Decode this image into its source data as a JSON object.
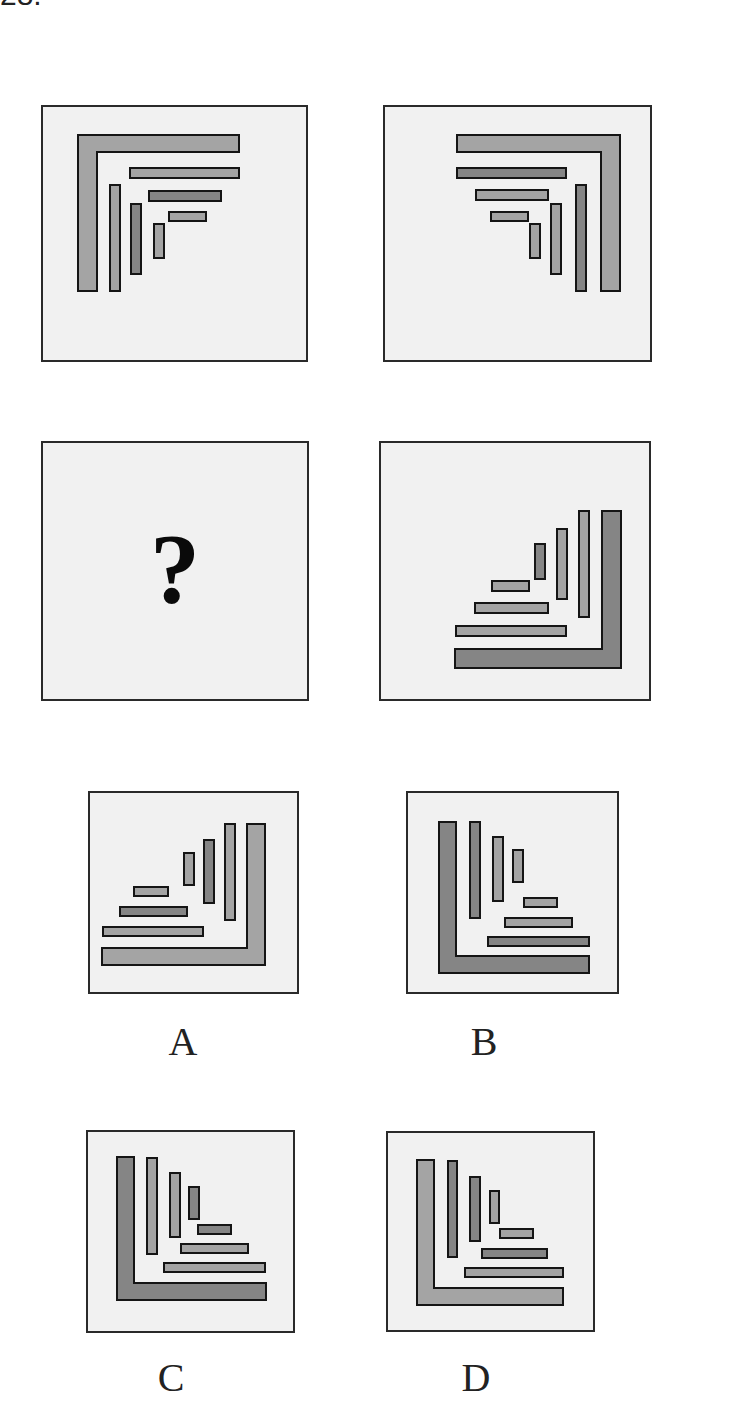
{
  "question": {
    "number": "28."
  },
  "colors": {
    "panel_bg": "#f1f1f1",
    "border": "#2a2a2a",
    "light": "#a4a4a4",
    "dark": "#858585",
    "stroke": "#151515"
  },
  "question_mark": "?",
  "panels": [
    {
      "id": "p1",
      "x": 41,
      "y": 105,
      "w": 267,
      "h": 257,
      "L": {
        "points": "37,30 198,30 198,47 56,47 56,186 37,186",
        "shade": "light"
      },
      "bars": [
        {
          "x": 89,
          "y": 63,
          "w": 109,
          "h": 10,
          "shade": "light"
        },
        {
          "x": 108,
          "y": 86,
          "w": 72,
          "h": 10,
          "shade": "dark"
        },
        {
          "x": 128,
          "y": 107,
          "w": 37,
          "h": 9,
          "shade": "light"
        },
        {
          "x": 69,
          "y": 80,
          "w": 10,
          "h": 106,
          "shade": "light"
        },
        {
          "x": 90,
          "y": 99,
          "w": 10,
          "h": 70,
          "shade": "dark"
        },
        {
          "x": 113,
          "y": 119,
          "w": 10,
          "h": 34,
          "shade": "light"
        }
      ]
    },
    {
      "id": "p2",
      "x": 383,
      "y": 105,
      "w": 269,
      "h": 257,
      "L": {
        "points": "74,30 237,30 237,186 218,186 218,47 74,47",
        "shade": "light"
      },
      "bars": [
        {
          "x": 74,
          "y": 63,
          "w": 109,
          "h": 10,
          "shade": "dark"
        },
        {
          "x": 93,
          "y": 85,
          "w": 72,
          "h": 10,
          "shade": "light"
        },
        {
          "x": 108,
          "y": 107,
          "w": 37,
          "h": 9,
          "shade": "light"
        },
        {
          "x": 193,
          "y": 80,
          "w": 10,
          "h": 106,
          "shade": "dark"
        },
        {
          "x": 168,
          "y": 99,
          "w": 10,
          "h": 70,
          "shade": "light"
        },
        {
          "x": 147,
          "y": 119,
          "w": 10,
          "h": 34,
          "shade": "light"
        }
      ]
    },
    {
      "id": "p3",
      "x": 41,
      "y": 441,
      "w": 268,
      "h": 260,
      "question_panel": true
    },
    {
      "id": "p4",
      "x": 379,
      "y": 441,
      "w": 272,
      "h": 260,
      "L": {
        "points": "223,70 242,70 242,227 76,227 76,208 223,208",
        "shade": "dark"
      },
      "bars": [
        {
          "x": 77,
          "y": 185,
          "w": 110,
          "h": 10,
          "shade": "light"
        },
        {
          "x": 96,
          "y": 162,
          "w": 73,
          "h": 10,
          "shade": "light"
        },
        {
          "x": 113,
          "y": 140,
          "w": 37,
          "h": 10,
          "shade": "light"
        },
        {
          "x": 200,
          "y": 70,
          "w": 10,
          "h": 106,
          "shade": "light"
        },
        {
          "x": 178,
          "y": 88,
          "w": 10,
          "h": 70,
          "shade": "light"
        },
        {
          "x": 156,
          "y": 103,
          "w": 10,
          "h": 35,
          "shade": "dark"
        }
      ]
    },
    {
      "id": "optA",
      "x": 88,
      "y": 791,
      "w": 211,
      "h": 203,
      "label": "A",
      "label_x": 168,
      "label_y": 1018,
      "L": {
        "points": "159,33 177,33 177,174 14,174 14,157 159,157",
        "shade": "light"
      },
      "bars": [
        {
          "x": 15,
          "y": 136,
          "w": 100,
          "h": 9,
          "shade": "light"
        },
        {
          "x": 32,
          "y": 116,
          "w": 67,
          "h": 9,
          "shade": "dark"
        },
        {
          "x": 46,
          "y": 96,
          "w": 34,
          "h": 9,
          "shade": "light"
        },
        {
          "x": 137,
          "y": 33,
          "w": 10,
          "h": 96,
          "shade": "light"
        },
        {
          "x": 116,
          "y": 49,
          "w": 10,
          "h": 63,
          "shade": "dark"
        },
        {
          "x": 96,
          "y": 62,
          "w": 10,
          "h": 32,
          "shade": "light"
        }
      ]
    },
    {
      "id": "optB",
      "x": 406,
      "y": 791,
      "w": 213,
      "h": 203,
      "label": "B",
      "label_x": 469,
      "label_y": 1018,
      "L": {
        "points": "33,31 50,31 50,165 183,165 183,182 33,182",
        "shade": "dark"
      },
      "bars": [
        {
          "x": 82,
          "y": 146,
          "w": 101,
          "h": 9,
          "shade": "dark"
        },
        {
          "x": 99,
          "y": 127,
          "w": 67,
          "h": 9,
          "shade": "light"
        },
        {
          "x": 118,
          "y": 107,
          "w": 33,
          "h": 9,
          "shade": "light"
        },
        {
          "x": 64,
          "y": 31,
          "w": 10,
          "h": 96,
          "shade": "dark"
        },
        {
          "x": 87,
          "y": 46,
          "w": 10,
          "h": 64,
          "shade": "light"
        },
        {
          "x": 107,
          "y": 59,
          "w": 10,
          "h": 32,
          "shade": "light"
        }
      ]
    },
    {
      "id": "optC",
      "x": 86,
      "y": 1130,
      "w": 209,
      "h": 203,
      "label": "C",
      "label_x": 156,
      "label_y": 1354,
      "L": {
        "points": "31,27 48,27 48,153 180,153 180,170 31,170",
        "shade": "dark"
      },
      "bars": [
        {
          "x": 78,
          "y": 133,
          "w": 101,
          "h": 9,
          "shade": "light"
        },
        {
          "x": 95,
          "y": 114,
          "w": 67,
          "h": 9,
          "shade": "light"
        },
        {
          "x": 112,
          "y": 95,
          "w": 33,
          "h": 9,
          "shade": "dark"
        },
        {
          "x": 61,
          "y": 28,
          "w": 10,
          "h": 96,
          "shade": "light"
        },
        {
          "x": 84,
          "y": 43,
          "w": 10,
          "h": 64,
          "shade": "light"
        },
        {
          "x": 103,
          "y": 57,
          "w": 10,
          "h": 32,
          "shade": "dark"
        }
      ]
    },
    {
      "id": "optD",
      "x": 386,
      "y": 1131,
      "w": 209,
      "h": 201,
      "label": "D",
      "label_x": 461,
      "label_y": 1354,
      "L": {
        "points": "31,29 48,29 48,157 177,157 177,174 31,174",
        "shade": "light"
      },
      "bars": [
        {
          "x": 79,
          "y": 137,
          "w": 98,
          "h": 9,
          "shade": "light"
        },
        {
          "x": 96,
          "y": 118,
          "w": 65,
          "h": 9,
          "shade": "dark"
        },
        {
          "x": 114,
          "y": 98,
          "w": 33,
          "h": 9,
          "shade": "light"
        },
        {
          "x": 62,
          "y": 30,
          "w": 9,
          "h": 96,
          "shade": "dark"
        },
        {
          "x": 84,
          "y": 46,
          "w": 10,
          "h": 64,
          "shade": "dark"
        },
        {
          "x": 104,
          "y": 60,
          "w": 9,
          "h": 32,
          "shade": "light"
        }
      ]
    }
  ]
}
